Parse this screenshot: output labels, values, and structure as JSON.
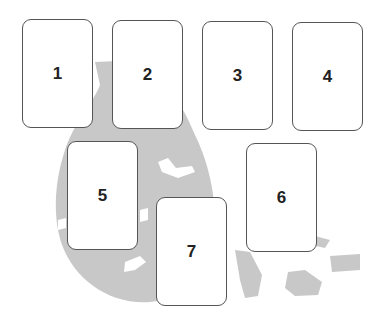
{
  "diagram": {
    "type": "card-spread-layout",
    "background_shape_color": "#c8c8c8",
    "cards": [
      {
        "label": "1",
        "x": 22,
        "y": 19
      },
      {
        "label": "2",
        "x": 112,
        "y": 20
      },
      {
        "label": "3",
        "x": 202,
        "y": 21
      },
      {
        "label": "4",
        "x": 292,
        "y": 22
      },
      {
        "label": "5",
        "x": 67,
        "y": 141
      },
      {
        "label": "6",
        "x": 246,
        "y": 143
      },
      {
        "label": "7",
        "x": 156,
        "y": 197
      }
    ]
  }
}
